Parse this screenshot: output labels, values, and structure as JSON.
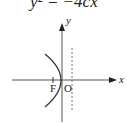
{
  "equation": "y² = −4cx",
  "axes": {
    "x_label": "x",
    "y_label": "y",
    "origin_label": "O"
  },
  "focus_label": "F",
  "colors": {
    "axis": "#555555",
    "curve": "#333333",
    "directrix": "#777777"
  }
}
